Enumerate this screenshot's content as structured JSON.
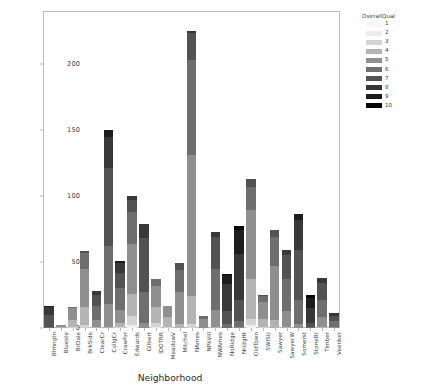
{
  "chart_data": {
    "type": "bar",
    "stacked": true,
    "title": "",
    "xlabel": "Neighborhood",
    "ylabel": "",
    "ylim": [
      0,
      240
    ],
    "yticks": [
      0,
      50,
      100,
      150,
      200
    ],
    "grid": false,
    "legend": {
      "title": "OverallQual",
      "position": "upper right outside",
      "entries": [
        {
          "label": "1",
          "color": "#f7f7f7"
        },
        {
          "label": "2",
          "color": "#ececec"
        },
        {
          "label": "3",
          "color": "#d4d4d4"
        },
        {
          "label": "4",
          "color": "#b4b4b4"
        },
        {
          "label": "5",
          "color": "#8f8f8f"
        },
        {
          "label": "6",
          "color": "#6e6e6e"
        },
        {
          "label": "7",
          "color": "#525252"
        },
        {
          "label": "8",
          "color": "#383838"
        },
        {
          "label": "9",
          "color": "#1d1d1d"
        },
        {
          "label": "10",
          "color": "#050505"
        }
      ]
    },
    "categories": [
      "Blmngtn",
      "Blueste",
      "BrDale",
      "BrkSide",
      "ClearCr",
      "CollgCr",
      "Crawfor",
      "Edwards",
      "Gilbert",
      "IDOTRR",
      "MeadowV",
      "Mitchel",
      "NAmes",
      "NPkVill",
      "NWAmes",
      "NoRidge",
      "NridgHt",
      "OldTown",
      "SWISU",
      "Sawyer",
      "SawyerW",
      "Somerst",
      "StoneBr",
      "Timber",
      "Veenker"
    ],
    "totals": [
      17,
      2,
      16,
      58,
      28,
      150,
      51,
      100,
      79,
      37,
      17,
      49,
      225,
      9,
      73,
      41,
      77,
      113,
      25,
      74,
      59,
      86,
      25,
      38,
      11
    ],
    "series": [
      {
        "name": "1",
        "color": "#f7f7f7",
        "values": [
          0,
          0,
          0,
          0,
          0,
          0,
          0,
          1,
          0,
          0,
          0,
          0,
          0,
          0,
          0,
          0,
          0,
          1,
          0,
          0,
          0,
          0,
          0,
          0,
          0
        ]
      },
      {
        "name": "2",
        "color": "#ececec",
        "values": [
          0,
          0,
          0,
          0,
          0,
          0,
          0,
          1,
          0,
          1,
          0,
          0,
          0,
          0,
          0,
          0,
          0,
          1,
          0,
          0,
          0,
          0,
          0,
          0,
          0
        ]
      },
      {
        "name": "3",
        "color": "#d4d4d4",
        "values": [
          0,
          0,
          1,
          2,
          0,
          0,
          1,
          7,
          0,
          3,
          1,
          0,
          3,
          0,
          0,
          0,
          0,
          5,
          1,
          0,
          0,
          0,
          0,
          0,
          0
        ]
      },
      {
        "name": "4",
        "color": "#b4b4b4",
        "values": [
          0,
          1,
          5,
          14,
          1,
          1,
          3,
          17,
          0,
          12,
          7,
          3,
          21,
          0,
          1,
          0,
          0,
          30,
          6,
          6,
          1,
          0,
          0,
          1,
          0
        ]
      },
      {
        "name": "5",
        "color": "#8f8f8f",
        "values": [
          0,
          1,
          9,
          29,
          5,
          17,
          10,
          38,
          4,
          16,
          9,
          24,
          107,
          7,
          13,
          0,
          1,
          52,
          13,
          41,
          12,
          3,
          0,
          7,
          1
        ]
      },
      {
        "name": "6",
        "color": "#6e6e6e",
        "values": [
          1,
          0,
          1,
          12,
          11,
          44,
          16,
          24,
          23,
          5,
          0,
          17,
          72,
          2,
          31,
          3,
          4,
          18,
          4,
          22,
          24,
          18,
          1,
          13,
          4
        ]
      },
      {
        "name": "7",
        "color": "#525252",
        "values": [
          9,
          0,
          0,
          1,
          8,
          59,
          12,
          9,
          41,
          0,
          0,
          5,
          20,
          0,
          24,
          10,
          16,
          6,
          1,
          5,
          18,
          38,
          3,
          13,
          4
        ]
      },
      {
        "name": "8",
        "color": "#383838",
        "values": [
          6,
          0,
          0,
          0,
          3,
          24,
          7,
          3,
          11,
          0,
          0,
          0,
          2,
          0,
          4,
          20,
          35,
          0,
          0,
          0,
          4,
          23,
          11,
          4,
          2
        ]
      },
      {
        "name": "9",
        "color": "#1d1d1d",
        "values": [
          1,
          0,
          0,
          0,
          0,
          5,
          2,
          0,
          0,
          0,
          0,
          0,
          0,
          0,
          0,
          7,
          18,
          0,
          0,
          0,
          0,
          4,
          8,
          0,
          0
        ]
      },
      {
        "name": "10",
        "color": "#050505",
        "values": [
          0,
          0,
          0,
          0,
          0,
          0,
          0,
          0,
          0,
          0,
          0,
          0,
          0,
          0,
          0,
          1,
          3,
          0,
          0,
          0,
          0,
          0,
          2,
          0,
          0
        ]
      }
    ]
  }
}
